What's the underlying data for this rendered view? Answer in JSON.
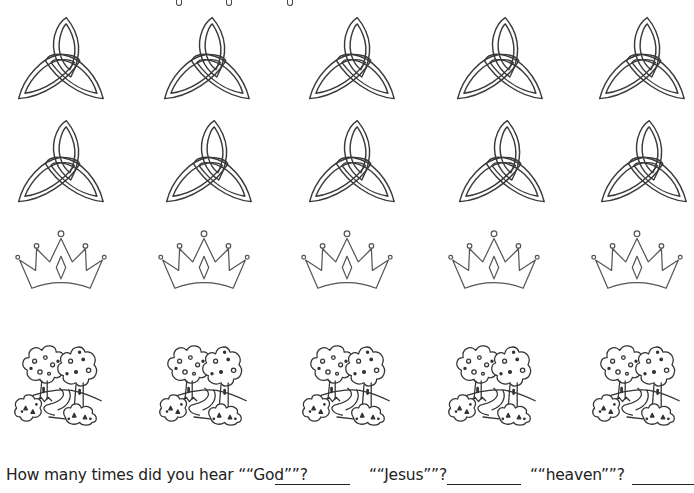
{
  "worksheet": {
    "title_partial": "",
    "rows": [
      {
        "name": "trinity-knot-row-1",
        "icon": "trinity-knot-icon",
        "count": 5
      },
      {
        "name": "trinity-knot-row-2",
        "icon": "trinity-knot-icon",
        "count": 5
      },
      {
        "name": "crown-row",
        "icon": "crown-icon",
        "count": 5
      },
      {
        "name": "trees-row",
        "icon": "trees-icon",
        "count": 5
      }
    ],
    "question": {
      "prompt_god": "How many times did you hear ““God””?",
      "prompt_jesus": "““Jesus””?",
      "prompt_heaven": "““heaven””?",
      "answer_god": "",
      "answer_jesus": "",
      "answer_heaven": ""
    }
  },
  "colors": {
    "ink": "#333333",
    "background": "#ffffff"
  }
}
